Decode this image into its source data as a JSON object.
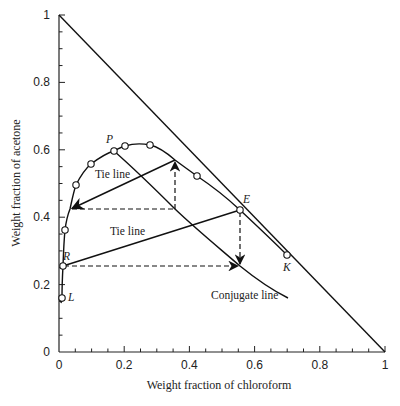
{
  "chart_data": {
    "type": "line",
    "title": "",
    "xlabel": "Weight fraction of chloroform",
    "ylabel": "Weight fraction of acetone",
    "xlim": [
      0,
      1
    ],
    "ylim": [
      0,
      1
    ],
    "grid": false,
    "legend": null,
    "x_ticks": [
      "0",
      "0.2",
      "0.4",
      "0.6",
      "0.8",
      "1"
    ],
    "y_ticks": [
      "0",
      "0.2",
      "0.4",
      "0.6",
      "0.8",
      "1"
    ],
    "series": [
      {
        "name": "Hypotenuse (x + y = 1)",
        "style": "solid",
        "points": [
          [
            0,
            1
          ],
          [
            1,
            0
          ]
        ]
      },
      {
        "name": "Binodal (solubility) curve",
        "style": "solid",
        "points": [
          [
            0.005,
            0.15
          ],
          [
            0.01,
            0.16
          ],
          [
            0.012,
            0.255
          ],
          [
            0.02,
            0.36
          ],
          [
            0.034,
            0.424
          ],
          [
            0.05,
            0.495
          ],
          [
            0.1,
            0.558
          ],
          [
            0.17,
            0.596
          ],
          [
            0.2,
            0.611
          ],
          [
            0.28,
            0.614
          ],
          [
            0.356,
            0.57
          ],
          [
            0.42,
            0.522
          ],
          [
            0.555,
            0.42
          ],
          [
            0.7,
            0.288
          ]
        ]
      },
      {
        "name": "Experimental points",
        "style": "markers",
        "marker": "open-circle",
        "points": [
          [
            0.01,
            0.16
          ],
          [
            0.012,
            0.255
          ],
          [
            0.02,
            0.36
          ],
          [
            0.05,
            0.495
          ],
          [
            0.1,
            0.558
          ],
          [
            0.17,
            0.596
          ],
          [
            0.2,
            0.611
          ],
          [
            0.28,
            0.614
          ],
          [
            0.42,
            0.522
          ],
          [
            0.555,
            0.42
          ],
          [
            0.7,
            0.288
          ]
        ]
      },
      {
        "name": "Conjugate line",
        "style": "solid",
        "points": [
          [
            0.17,
            0.596
          ],
          [
            0.356,
            0.424
          ],
          [
            0.555,
            0.255
          ],
          [
            0.7,
            0.16
          ]
        ]
      },
      {
        "name": "Tie line 1",
        "style": "solid-arrow",
        "points": [
          [
            0.356,
            0.57
          ],
          [
            0.034,
            0.424
          ]
        ]
      },
      {
        "name": "Tie line 2",
        "style": "solid-arrow",
        "points": [
          [
            0.012,
            0.255
          ],
          [
            0.555,
            0.42
          ]
        ]
      },
      {
        "name": "Construction 1",
        "style": "dashed-arrow",
        "points": [
          [
            0.034,
            0.424
          ],
          [
            0.356,
            0.424
          ],
          [
            0.356,
            0.57
          ]
        ]
      },
      {
        "name": "Construction 2",
        "style": "dashed-arrow",
        "points": [
          [
            0.555,
            0.42
          ],
          [
            0.555,
            0.255
          ],
          [
            0.012,
            0.255
          ]
        ]
      }
    ],
    "annotations": [
      {
        "text": "P",
        "x": 0.17,
        "y": 0.596
      },
      {
        "text": "E",
        "x": 0.555,
        "y": 0.42
      },
      {
        "text": "K",
        "x": 0.7,
        "y": 0.288
      },
      {
        "text": "R",
        "x": 0.012,
        "y": 0.255
      },
      {
        "text": "L",
        "x": 0.01,
        "y": 0.16
      },
      {
        "text": "Tie line",
        "x": 0.12,
        "y": 0.52
      },
      {
        "text": "Tie line",
        "x": 0.14,
        "y": 0.34
      },
      {
        "text": "Conjugate line",
        "x": 0.55,
        "y": 0.15
      }
    ]
  },
  "labels": {
    "xlabel": "Weight fraction of chloroform",
    "ylabel": "Weight fraction of acetone",
    "x_ticks": [
      "0",
      "0.2",
      "0.4",
      "0.6",
      "0.8",
      "1"
    ],
    "y_ticks": [
      "0",
      "0.2",
      "0.4",
      "0.6",
      "0.8",
      "1"
    ],
    "tie_line_1": "Tie line",
    "tie_line_2": "Tie line",
    "conjugate_line": "Conjugate line",
    "point_P": "P",
    "point_E": "E",
    "point_K": "K",
    "point_R": "R",
    "point_L": "L"
  }
}
